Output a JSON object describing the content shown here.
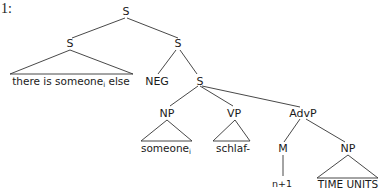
{
  "example_label": "1:",
  "tree": {
    "root": "S",
    "left_s": "S",
    "left_s_leaf": "there is someone",
    "left_s_leaf_subscript": "i",
    "left_s_leaf_tail": " else",
    "right_s": "S",
    "neg": "NEG",
    "lower_s": "S",
    "np": "NP",
    "np_leaf": "someone",
    "np_leaf_subscript": "i",
    "vp": "VP",
    "vp_leaf": "schlaf-",
    "advp": "AdvP",
    "m": "M",
    "m_leaf": "n+1",
    "advp_np": "NP",
    "advp_np_leaf": "TIME UNITS"
  }
}
